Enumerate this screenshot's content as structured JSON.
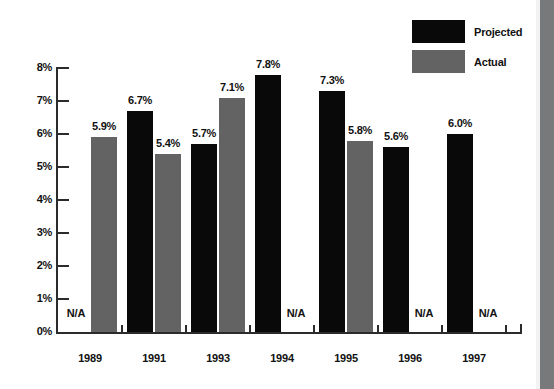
{
  "chart_data": {
    "type": "bar",
    "title": "",
    "subtitle": "",
    "xlabel": "",
    "ylabel": "",
    "categories": [
      "1989",
      "1991",
      "1993",
      "1994",
      "1995",
      "1996",
      "1997"
    ],
    "ylim": [
      0,
      8
    ],
    "ytick_labels": [
      "0%",
      "1%",
      "2%",
      "3%",
      "4%",
      "5%",
      "6%",
      "7%",
      "8%"
    ],
    "ytick_values": [
      0,
      1,
      2,
      3,
      4,
      5,
      6,
      7,
      8
    ],
    "grid": false,
    "legend_position": "top-right",
    "na_text": "N/A",
    "series": [
      {
        "name": "Projected",
        "color": "#090909",
        "values": [
          null,
          6.7,
          5.7,
          7.8,
          7.3,
          5.6,
          6.0
        ],
        "labels": [
          "N/A",
          "6.7%",
          "5.7%",
          "7.8%",
          "7.3%",
          "5.6%",
          "6.0%"
        ]
      },
      {
        "name": "Actual",
        "color": "#636363",
        "values": [
          5.9,
          5.4,
          7.1,
          null,
          5.8,
          null,
          null
        ],
        "labels": [
          "5.9%",
          "5.4%",
          "7.1%",
          "N/A",
          "5.8%",
          "N/A",
          "N/A"
        ]
      }
    ]
  },
  "legend": {
    "items": [
      {
        "label": "Projected",
        "color": "#090909"
      },
      {
        "label": "Actual",
        "color": "#636363"
      }
    ]
  },
  "axes": {
    "y_ticks": [
      {
        "label": "8%",
        "value": 8
      },
      {
        "label": "7%",
        "value": 7
      },
      {
        "label": "6%",
        "value": 6
      },
      {
        "label": "5%",
        "value": 5
      },
      {
        "label": "4%",
        "value": 4
      },
      {
        "label": "3%",
        "value": 3
      },
      {
        "label": "2%",
        "value": 2
      },
      {
        "label": "1%",
        "value": 1
      },
      {
        "label": "0%",
        "value": 0
      }
    ],
    "x_labels": [
      "1989",
      "1991",
      "1993",
      "1994",
      "1995",
      "1996",
      "1997"
    ]
  }
}
